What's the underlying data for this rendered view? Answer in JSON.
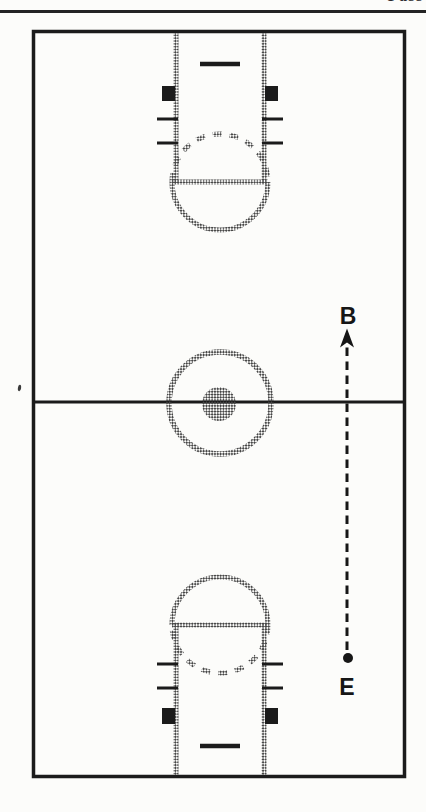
{
  "page": {
    "background_color": "#fcfcfa",
    "header": {
      "rule_color": "#242424",
      "clipped_title": "Pass"
    }
  },
  "diagram": {
    "kind": "basketball-full-court-play-diagram",
    "ink_color": "#1b1b1b",
    "stipple_color": "#474747",
    "arrow_color": "#161616",
    "labels": {
      "receiver": "B",
      "passer": "E"
    },
    "play_arrow": {
      "style": "dashed",
      "from_label": "E",
      "to_label": "B",
      "direction": "up"
    }
  }
}
